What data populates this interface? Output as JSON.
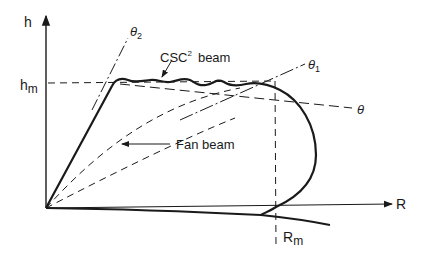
{
  "diagram": {
    "axes": {
      "y_label": "h",
      "x_label": "R",
      "h_marker": "h",
      "h_marker_sub": "m",
      "r_marker": "R",
      "r_marker_sub": "m"
    },
    "angle_labels": {
      "theta2": "θ",
      "theta2_sub": "2",
      "theta1": "θ",
      "theta1_sub": "1",
      "theta": "θ"
    },
    "curve_labels": {
      "csc_beam_main": "CSC",
      "csc_beam_sup": "2",
      "csc_beam_tail": "beam",
      "fan_beam": "Fan beam"
    },
    "colors": {
      "ink": "#1a1a1a",
      "background": "#ffffff"
    }
  }
}
